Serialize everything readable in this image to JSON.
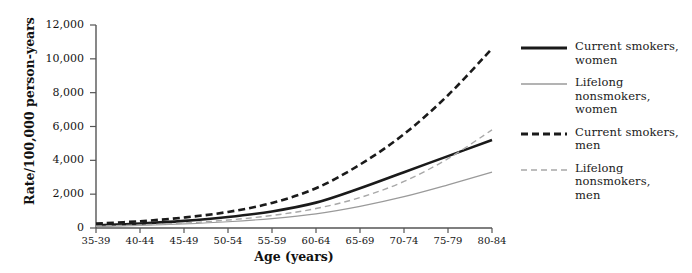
{
  "chart_data": {
    "type": "line",
    "title": "",
    "xlabel": "Age (years)",
    "ylabel": "Rate/100,000 person-years",
    "categories": [
      "35-39",
      "40-44",
      "45-49",
      "50-54",
      "55-59",
      "60-64",
      "65-69",
      "70-74",
      "75-79",
      "80-84"
    ],
    "ylim": [
      0,
      12000
    ],
    "yticks": [
      0,
      2000,
      4000,
      6000,
      8000,
      10000,
      12000
    ],
    "ytick_labels": [
      "0",
      "2,000",
      "4,000",
      "6,000",
      "8,000",
      "10,000",
      "12,000"
    ],
    "grid": false,
    "legend_position": "right",
    "series": [
      {
        "name": "Current smokers, women",
        "style": "solid",
        "color": "#1a1a1a",
        "width": 2.6,
        "values": [
          150,
          260,
          420,
          650,
          980,
          1500,
          2350,
          3300,
          4250,
          5200
        ]
      },
      {
        "name": "Lifelong nonsmokers, women",
        "style": "solid",
        "color": "#9a9a9a",
        "width": 1.2,
        "values": [
          95,
          150,
          240,
          370,
          560,
          840,
          1280,
          1850,
          2550,
          3300
        ]
      },
      {
        "name": "Current smokers, men",
        "style": "dashed",
        "color": "#1a1a1a",
        "width": 2.6,
        "values": [
          260,
          400,
          620,
          950,
          1480,
          2350,
          3750,
          5550,
          7850,
          10600
        ]
      },
      {
        "name": "Lifelong nonsmokers, men",
        "style": "dashed",
        "color": "#a8a8a8",
        "width": 1.4,
        "values": [
          110,
          180,
          290,
          470,
          740,
          1150,
          1800,
          2750,
          4100,
          5800
        ]
      }
    ]
  },
  "legend": {
    "items": [
      {
        "label_line1": "Current smokers,",
        "label_line2": "women",
        "label_line3": ""
      },
      {
        "label_line1": "Lifelong",
        "label_line2": "nonsmokers,",
        "label_line3": "women"
      },
      {
        "label_line1": "Current smokers,",
        "label_line2": "men",
        "label_line3": ""
      },
      {
        "label_line1": "Lifelong",
        "label_line2": "nonsmokers,",
        "label_line3": "men"
      }
    ]
  },
  "colors": {
    "axis": "#555555",
    "dark_line": "#1a1a1a",
    "light_line": "#9a9a9a",
    "background": "#ffffff"
  }
}
